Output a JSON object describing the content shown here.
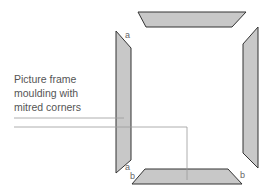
{
  "caption": {
    "lines": [
      "Picture frame",
      "moulding with",
      "mitred corners"
    ]
  },
  "corner_labels": {
    "top_left": "a",
    "bottom_left_a": "a",
    "bottom_left_b": "b",
    "bottom_right_b": "b"
  },
  "colors": {
    "piece_fill": "#c8c8c8",
    "piece_stroke": "#333333",
    "leader_line": "#999999",
    "text": "#555555"
  }
}
